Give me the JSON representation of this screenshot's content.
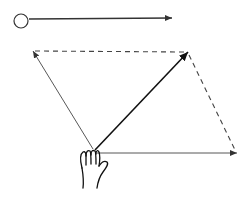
{
  "diagram": {
    "type": "vector-addition-parallelogram",
    "colors": {
      "stroke": "#222222",
      "thin_stroke": "#444444",
      "background": "#ffffff"
    },
    "reference_arrow": {
      "circle": {
        "cx": 21,
        "cy": 21,
        "r": 7
      },
      "line": {
        "x1": 29,
        "y1": 19,
        "x2": 172,
        "y2": 18
      }
    },
    "origin": {
      "x": 95,
      "y": 152
    },
    "vectors": {
      "left": {
        "x2": 33,
        "y2": 51,
        "style": "solid-thin"
      },
      "bottom": {
        "x2": 237,
        "y2": 153,
        "style": "solid-thin"
      },
      "resultant": {
        "x2": 188,
        "y2": 52,
        "style": "solid-thick"
      }
    },
    "dashed_edges": [
      {
        "x1": 33,
        "y1": 51,
        "x2": 188,
        "y2": 52
      },
      {
        "x1": 188,
        "y1": 52,
        "x2": 237,
        "y2": 153
      }
    ],
    "icons": [
      "hand-icon",
      "circle-icon"
    ]
  }
}
